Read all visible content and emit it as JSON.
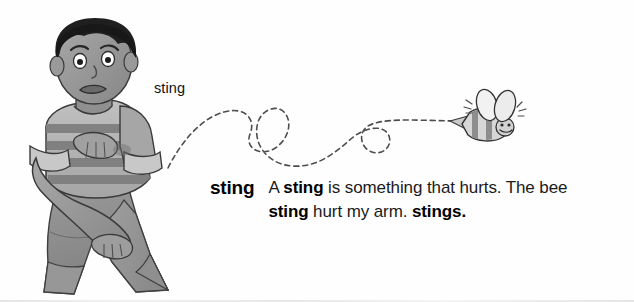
{
  "page": {
    "background_color": "#fefefe",
    "ink_color": "#1a1a1a"
  },
  "illustration": {
    "description": "Grayscale drawing of a boy holding his stung arm while a bee flies away along a looping dashed flight path",
    "palette": {
      "hair": "#201f1f",
      "skin": "#9a9a9a",
      "skin_shadow": "#7d7d7d",
      "shirt_light": "#b4b4b4",
      "shirt_stripe": "#7f7f7f",
      "shorts": "#8d8d8d",
      "outline": "#3a3a3a",
      "bee_body": "#d8d8d8",
      "bee_stripe": "#8a8a8a",
      "path": "#4a4a4a"
    },
    "boy": {
      "expression": "worried-frown",
      "pose": "clutching-left-arm"
    },
    "bee": {
      "direction": "flying-left",
      "wings": 2,
      "has_stinger": true
    },
    "flight_path": {
      "style": "dashed",
      "loops": 2
    }
  },
  "path_label": {
    "text": "sting"
  },
  "entry": {
    "headword": "sting",
    "definition_parts": [
      {
        "text": "A ",
        "style": "normal"
      },
      {
        "text": "sting",
        "style": "semibold"
      },
      {
        "text": " is something that hurts. The bee ",
        "style": "normal"
      },
      {
        "text": "sting",
        "style": "semibold"
      },
      {
        "text": " hurt my arm. ",
        "style": "normal"
      },
      {
        "text": "stings.",
        "style": "bold"
      }
    ],
    "definition_plain": "A sting is something that hurts. The bee sting hurt my arm. stings."
  }
}
